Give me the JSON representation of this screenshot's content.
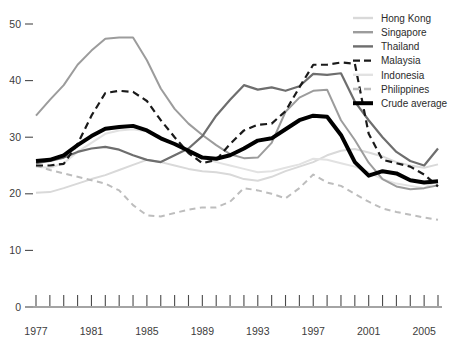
{
  "chart_data": {
    "type": "line",
    "title": "",
    "xlabel": "",
    "ylabel": "",
    "xlim": [
      1977,
      2006
    ],
    "ylim": [
      0,
      52
    ],
    "grid": false,
    "legend_position": "top-right",
    "x_ticks_labeled": [
      "1977",
      "1981",
      "1985",
      "1989",
      "1993",
      "1997",
      "2001",
      "2005"
    ],
    "x_ticks_all": [
      1977,
      1978,
      1979,
      1980,
      1981,
      1982,
      1983,
      1984,
      1985,
      1986,
      1987,
      1988,
      1989,
      1990,
      1991,
      1992,
      1993,
      1994,
      1995,
      1996,
      1997,
      1998,
      1999,
      2000,
      2001,
      2002,
      2003,
      2004,
      2005,
      2006
    ],
    "y_ticks": [
      0,
      10,
      20,
      30,
      40,
      50
    ],
    "x": [
      1977,
      1978,
      1979,
      1980,
      1981,
      1982,
      1983,
      1984,
      1985,
      1986,
      1987,
      1988,
      1989,
      1990,
      1991,
      1992,
      1993,
      1994,
      1995,
      1996,
      1997,
      1998,
      1999,
      2000,
      2001,
      2002,
      2003,
      2004,
      2005,
      2006
    ],
    "series": [
      {
        "name": "Hong Kong",
        "color": "#d9d9d9",
        "style": "solid",
        "width": 2.0,
        "values": [
          20.2,
          20.3,
          21.0,
          21.8,
          22.6,
          23.3,
          24.2,
          25.1,
          26.0,
          25.6,
          25.0,
          24.4,
          24.0,
          23.8,
          23.4,
          22.6,
          22.3,
          23.0,
          24.0,
          24.8,
          25.6,
          26.8,
          27.6,
          27.9,
          27.3,
          26.6,
          25.6,
          25.0,
          24.6,
          25.2
        ]
      },
      {
        "name": "Singapore",
        "color": "#9c9c9c",
        "style": "solid",
        "width": 2.0,
        "values": [
          33.8,
          36.6,
          39.2,
          42.8,
          45.3,
          47.4,
          47.6,
          47.6,
          43.6,
          38.6,
          35.0,
          32.4,
          30.4,
          28.6,
          27.0,
          26.3,
          26.4,
          29.0,
          34.5,
          37.0,
          38.2,
          38.4,
          33.0,
          29.5,
          25.5,
          22.6,
          21.3,
          20.8,
          21.0,
          21.5
        ]
      },
      {
        "name": "Thailand",
        "color": "#6e6e6e",
        "style": "solid",
        "width": 2.2,
        "values": [
          25.4,
          25.8,
          26.4,
          27.4,
          28.0,
          28.3,
          27.8,
          26.8,
          26.0,
          25.6,
          26.8,
          28.0,
          30.2,
          33.8,
          36.6,
          39.2,
          38.4,
          38.8,
          38.2,
          39.0,
          41.2,
          41.0,
          41.3,
          36.3,
          33.0,
          30.0,
          27.4,
          25.8,
          25.0,
          28.0
        ]
      },
      {
        "name": "Malaysia",
        "color": "#1a1a1a",
        "style": "dashed",
        "width": 2.2,
        "values": [
          25.0,
          25.0,
          25.3,
          28.8,
          33.8,
          37.8,
          38.2,
          38.0,
          36.4,
          33.0,
          30.0,
          27.2,
          25.4,
          26.0,
          28.8,
          31.2,
          32.2,
          32.4,
          34.6,
          38.8,
          42.8,
          42.8,
          43.2,
          43.0,
          30.6,
          26.0,
          25.4,
          24.8,
          23.4,
          21.3
        ]
      },
      {
        "name": "Indonesia",
        "color": "#e2e2e2",
        "style": "solid",
        "width": 2.0,
        "values": [
          24.8,
          24.6,
          25.4,
          27.4,
          29.0,
          30.6,
          31.2,
          31.4,
          31.0,
          30.0,
          28.8,
          27.6,
          26.4,
          25.6,
          25.0,
          24.4,
          23.8,
          24.0,
          24.6,
          25.2,
          26.2,
          26.0,
          25.4,
          24.8,
          23.8,
          22.6,
          21.8,
          21.4,
          21.0,
          22.4
        ]
      },
      {
        "name": "Philippines",
        "color": "#bdbdbd",
        "style": "dashed",
        "width": 2.0,
        "values": [
          25.0,
          24.2,
          23.6,
          23.0,
          22.4,
          21.8,
          20.6,
          18.0,
          16.2,
          16.0,
          16.6,
          17.2,
          17.6,
          17.6,
          18.6,
          21.0,
          20.6,
          20.0,
          19.2,
          21.0,
          23.4,
          22.0,
          21.4,
          20.0,
          18.6,
          17.4,
          16.8,
          16.3,
          15.8,
          15.4
        ]
      },
      {
        "name": "Crude average",
        "color": "#000000",
        "style": "solid",
        "width": 4.0,
        "values": [
          25.8,
          26.0,
          26.8,
          28.6,
          30.2,
          31.5,
          31.8,
          32.0,
          31.2,
          29.8,
          28.8,
          27.6,
          26.4,
          26.2,
          26.8,
          28.0,
          29.4,
          29.8,
          31.4,
          33.0,
          33.8,
          33.6,
          30.4,
          25.6,
          23.2,
          24.0,
          23.6,
          22.4,
          22.0,
          22.2
        ]
      }
    ]
  },
  "legend": {
    "items": [
      {
        "label": "Hong Kong"
      },
      {
        "label": "Singapore"
      },
      {
        "label": "Thailand"
      },
      {
        "label": "Malaysia"
      },
      {
        "label": "Indonesia"
      },
      {
        "label": "Philippines"
      },
      {
        "label": "Crude average"
      }
    ]
  },
  "axes": {
    "y_labels": [
      "50",
      "40",
      "30",
      "20",
      "10",
      "0"
    ],
    "x_labels": [
      "1977",
      "1981",
      "1985",
      "1989",
      "1993",
      "1997",
      "2001",
      "2005"
    ]
  }
}
